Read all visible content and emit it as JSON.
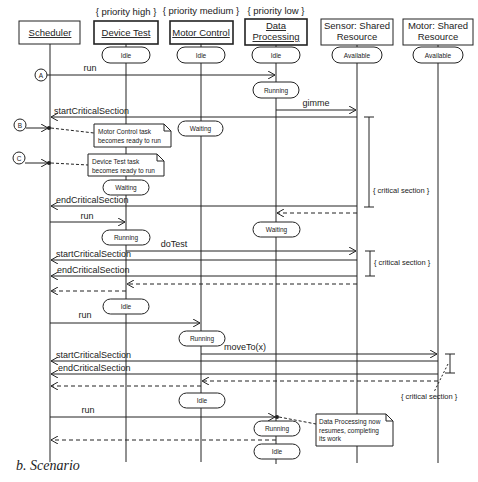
{
  "caption": "b. Scenario",
  "lifelines": [
    {
      "id": "scheduler",
      "label": "Scheduler",
      "underline": true,
      "stereotype": "",
      "x": 50,
      "initial_state": ""
    },
    {
      "id": "device-test",
      "label": "Device Test",
      "underline": true,
      "stereotype": "{ priority high }",
      "x": 126,
      "initial_state": "Idle"
    },
    {
      "id": "motor-control",
      "label": "Motor Control",
      "underline": true,
      "stereotype": "{ priority medium }",
      "x": 201,
      "initial_state": "Idle"
    },
    {
      "id": "data-processing",
      "label_lines": [
        "Data",
        "Processing"
      ],
      "underline": true,
      "stereotype": "{ priority low }",
      "x": 276,
      "initial_state": "Idle"
    },
    {
      "id": "sensor",
      "label_lines": [
        "Sensor: Shared",
        "Resource"
      ],
      "underline": false,
      "stereotype": "",
      "x": 357,
      "initial_state": "Available"
    },
    {
      "id": "motor",
      "label_lines": [
        "Motor: Shared",
        "Resource"
      ],
      "underline": false,
      "stereotype": "",
      "x": 438,
      "initial_state": "Available"
    }
  ],
  "header": {
    "scheduler": "Scheduler",
    "device_test": "Device Test",
    "motor_control": "Motor Control",
    "data_processing_1": "Data",
    "data_processing_2": "Processing",
    "sensor_1": "Sensor: Shared",
    "sensor_2": "Resource",
    "motor_1": "Motor: Shared",
    "motor_2": "Resource",
    "stereo_high": "{ priority high }",
    "stereo_medium": "{ priority medium }",
    "stereo_low": "{ priority low }"
  },
  "states": {
    "idle": "Idle",
    "running": "Running",
    "waiting": "Waiting",
    "available": "Available"
  },
  "events": {
    "a": "A",
    "b": "B",
    "c": "C"
  },
  "messages": {
    "run": "run",
    "gimme": "gimme",
    "start_cs": "startCriticalSection",
    "end_cs": "endCriticalSection",
    "do_test": "doTest",
    "move_to": "moveTo(x)"
  },
  "notes": {
    "motor_ready_1": "Motor Control task",
    "motor_ready_2": "becomes ready to run",
    "device_ready_1": "Device Test task",
    "device_ready_2": "becomes ready to run",
    "dp_resume_1": "Data Processing now",
    "dp_resume_2": "resumes, completing",
    "dp_resume_3": "its work"
  },
  "constraints": {
    "critical_section": "{ critical section }"
  }
}
